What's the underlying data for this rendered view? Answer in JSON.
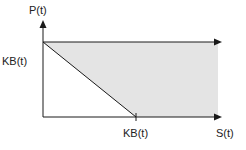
{
  "diagram": {
    "y_axis_label": "P(t)",
    "x_axis_label": "S(t)",
    "y_intercept_label": "KB(t)",
    "x_intercept_label": "KB(t)",
    "colors": {
      "line": "#1a1a1a",
      "shade": "#e4e4e4",
      "background": "#ffffff"
    }
  }
}
